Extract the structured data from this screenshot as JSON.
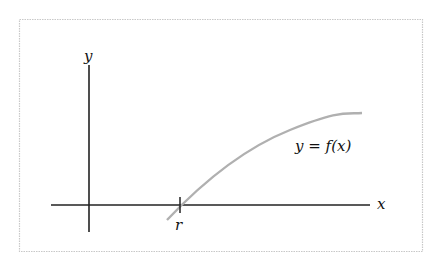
{
  "diagram": {
    "axes": {
      "x_label": "x",
      "y_label": "y"
    },
    "root_label": "r",
    "curve_label": "y = f(x)",
    "colors": {
      "axes": "#222222",
      "curve": "#b0b0b0",
      "frame": "#c8c8c8"
    }
  }
}
